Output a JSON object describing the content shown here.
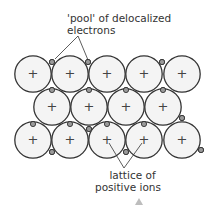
{
  "labels": {
    "top_line1": "'pool' of delocalized",
    "top_line2": "electrons",
    "bottom_line1": "lattice of",
    "bottom_line2": "positive ions"
  },
  "ion_symbol": "+",
  "colors": {
    "stroke": "#333333",
    "ion_fill": "#f4f4f4",
    "electron_fill": "#9a9a9a",
    "arrow": "#bdbdbd"
  },
  "rows": [
    {
      "y": 74,
      "x": [
        33,
        70,
        107,
        144,
        182
      ]
    },
    {
      "y": 107,
      "x": [
        52,
        89,
        126,
        163
      ]
    },
    {
      "y": 140,
      "x": [
        33,
        70,
        107,
        144,
        182
      ]
    }
  ]
}
